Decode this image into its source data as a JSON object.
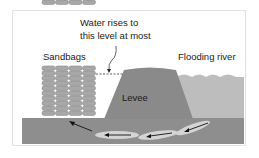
{
  "diagram": {
    "callout": {
      "line1": "Water rises to",
      "line2": "this level at most"
    },
    "labels": {
      "sandbags": "Sandbags",
      "river": "Flooding river",
      "levee": "Levee"
    },
    "sandbags": {
      "columns": 4,
      "rows": 10
    },
    "seepage_arrows": 4,
    "colors": {
      "ground": "#8e8e8e",
      "levee": "#8a8a8a",
      "water": "#bdbdbd",
      "sandbag": "#a8a8a8",
      "arrow_halo": "#d4d4d4",
      "arrow": "#111111",
      "frame": "#e2e2e2"
    }
  }
}
